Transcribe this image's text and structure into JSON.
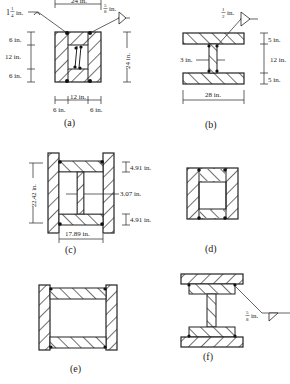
{
  "figure": {
    "panels": [
      {
        "id": "a",
        "caption": "(a)",
        "dims": {
          "top_width": "24 in.",
          "weld_left_whole": "1",
          "weld_left_frac_num": "1",
          "weld_left_frac_den": "4",
          "weld_left_unit": "in.",
          "weld_right_num": "5",
          "weld_right_den": "8",
          "weld_right_unit": "in.",
          "left_top": "6 in.",
          "left_mid": "12 in.",
          "left_bot": "6 in.",
          "right_height": "24 in.",
          "bottom_mid": "12 in.",
          "bottom_left": "6 in.",
          "bottom_right": "6 in."
        }
      },
      {
        "id": "b",
        "caption": "(b)",
        "dims": {
          "weld_num": "1",
          "weld_den": "2",
          "weld_unit": "in.",
          "web_thickness": "3 in.",
          "top_flange": "5 in.",
          "web_height": "12 in.",
          "bot_flange": "5 in.",
          "width": "28 in."
        }
      },
      {
        "id": "c",
        "caption": "(c)",
        "dims": {
          "height": "22.42 in.",
          "top_flange": "4.91 in.",
          "web": "3.07 in.",
          "bot_flange": "4.91 in.",
          "width": "17.89 in."
        }
      },
      {
        "id": "d",
        "caption": "(d)"
      },
      {
        "id": "e",
        "caption": "(e)"
      },
      {
        "id": "f",
        "caption": "(f)",
        "dims": {
          "weld_num": "5",
          "weld_den": "8",
          "weld_unit": "in."
        }
      }
    ]
  }
}
